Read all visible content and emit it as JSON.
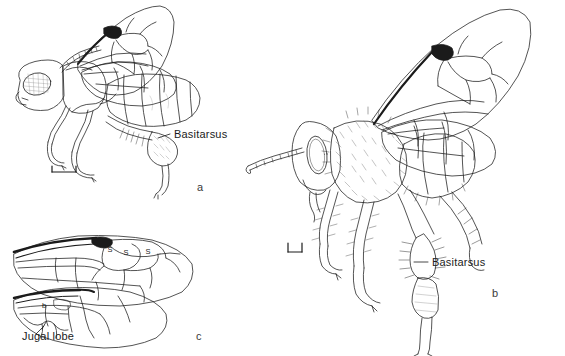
{
  "figure": {
    "type": "scientific-illustration",
    "background_color": "#ffffff",
    "ink_color": "#1b1b1b",
    "width": 565,
    "height": 356
  },
  "panels": [
    {
      "id": "a",
      "letter": "a",
      "description": "lateral view of a sparsely haired bee with wings folded over the abdomen",
      "labels": [
        {
          "name": "basitarsus",
          "text": "Basitarsus"
        }
      ],
      "scale_bar": {
        "present": true,
        "orientation": "horizontal-with-end-ticks"
      }
    },
    {
      "id": "b",
      "letter": "b",
      "description": "lateral view of a densely haired bee with outspread wings",
      "labels": [
        {
          "name": "basitarsus",
          "text": "Basitarsus"
        }
      ],
      "scale_bar": {
        "present": true,
        "orientation": "horizontal-with-end-ticks"
      }
    },
    {
      "id": "c",
      "letter": "c",
      "description": "detached forewing and hindwing showing venation",
      "labels": [
        {
          "name": "jugal-lobe",
          "text": "Jugal lobe"
        }
      ],
      "cell_marks": [
        "S",
        "S",
        "S"
      ],
      "hindwing_mark": "b",
      "scale_bar": {
        "present": false
      }
    }
  ],
  "labels": {
    "basitarsus_a": "Basitarsus",
    "basitarsus_b": "Basitarsus",
    "jugal_lobe": "Jugal lobe",
    "letter_a": "a",
    "letter_b": "b",
    "letter_c": "c",
    "cell_mark_1": "S",
    "cell_mark_2": "S",
    "cell_mark_3": "S",
    "hindwing_mark": "b"
  }
}
